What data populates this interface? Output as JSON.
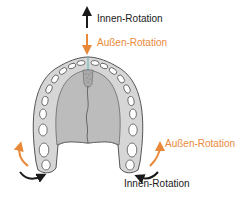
{
  "labels": {
    "top_inner": "Innen-Rotation",
    "top_outer": "Außen-Rotation",
    "right_outer": "Außen-Rotation",
    "bottom_inner": "Innen-Rotation"
  },
  "colors": {
    "inner_rotation": "#1a1a1a",
    "outer_rotation": "#e8893a",
    "arch_fill": "#d6d6d6",
    "palate_fill": "#bcbcbc",
    "outline": "#555555"
  }
}
